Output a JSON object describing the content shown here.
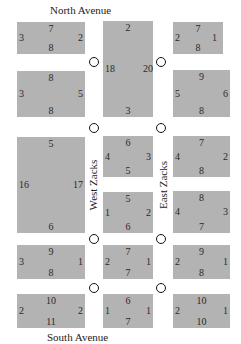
{
  "streets": {
    "north": "North Avenue",
    "south": "South Avenue",
    "west": "West Zacks",
    "east": "East Zacks"
  },
  "colors": {
    "block": "#b3b3b3",
    "background": "#ffffff",
    "circle_stroke": "#111111"
  },
  "blocks": [
    {
      "id": "L1",
      "top": "7",
      "left": "3",
      "right": "2",
      "bottom": "8"
    },
    {
      "id": "L2",
      "top": "8",
      "left": "3",
      "right": "5",
      "bottom": "8"
    },
    {
      "id": "L3",
      "top": "5",
      "left": "16",
      "right": "17",
      "bottom": "6"
    },
    {
      "id": "L4",
      "top": "9",
      "left": "3",
      "right": "1",
      "bottom": "8"
    },
    {
      "id": "L5",
      "top": "10",
      "left": "2",
      "right": "2",
      "bottom": "11"
    },
    {
      "id": "M1",
      "top": "2",
      "left": "18",
      "right": "20",
      "bottom": "3"
    },
    {
      "id": "M2",
      "top": "6",
      "left": "4",
      "right": "3",
      "bottom": "5"
    },
    {
      "id": "M3",
      "top": "5",
      "left": "1",
      "right": "2",
      "bottom": "6"
    },
    {
      "id": "M4",
      "top": "7",
      "left": "2",
      "right": "1",
      "bottom": "7"
    },
    {
      "id": "M5",
      "top": "6",
      "left": "1",
      "right": "1",
      "bottom": "7"
    },
    {
      "id": "R1",
      "top": "7",
      "left": "2",
      "right": "1",
      "bottom": "8"
    },
    {
      "id": "R2",
      "top": "9",
      "left": "5",
      "right": "6",
      "bottom": "8"
    },
    {
      "id": "R3",
      "top": "7",
      "left": "4",
      "right": "2",
      "bottom": "8"
    },
    {
      "id": "R4",
      "top": "8",
      "left": "4",
      "right": "3",
      "bottom": "7"
    },
    {
      "id": "R5",
      "top": "9",
      "left": "2",
      "right": "1",
      "bottom": "8"
    },
    {
      "id": "R6",
      "top": "10",
      "left": "2",
      "right": "1",
      "bottom": "10"
    }
  ],
  "intersections_count": 10
}
